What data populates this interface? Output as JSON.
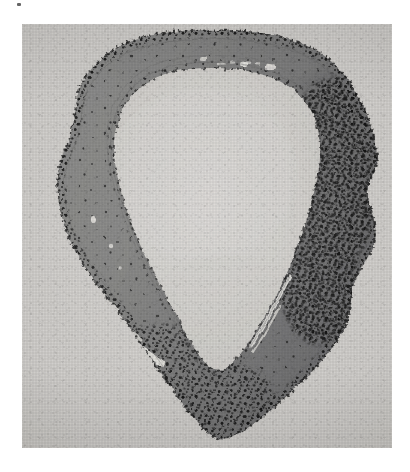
{
  "figure": {
    "kind": "photomicrograph",
    "modality": "brightfield light microscopy",
    "staining_tone": "grayscale halftone print"
  },
  "plate": {
    "left": 22,
    "top": 24,
    "width": 370,
    "height": 424,
    "background_color": "#d9d9d7",
    "border": "none"
  },
  "palette": {
    "page_white": "#ffffff",
    "print_background": "#d9d9d7",
    "background_light": "#dedcd9",
    "lumen_light": "#dbd9d6",
    "lumen_core": "#e2e0dd",
    "wall_mid_gray": "#8e8e8c",
    "wall_dark_gray": "#79797a",
    "wall_light_gray": "#a3a3a1",
    "nuclei_black": "#1d1d1d",
    "cleft_white": "#efeeea"
  },
  "regions": [
    {
      "id": "background",
      "name": "extra-luminal background",
      "description": "pale grainy field surrounding the specimen",
      "tone": "light gray"
    },
    {
      "id": "outer-wall",
      "name": "specimen wall",
      "description": "continuous medium-gray ring of tissue forming the full circumference",
      "tone": "medium gray"
    },
    {
      "id": "nuclei-band-outer",
      "name": "outer nuclear border",
      "description": "dashed line of dark nuclei following the outer contour",
      "tone": "black speckle"
    },
    {
      "id": "nuclei-band-inner",
      "name": "inner nuclear border",
      "description": "dark nuclei lining the luminal surface",
      "tone": "black speckle"
    },
    {
      "id": "dense-infiltrate-right",
      "name": "dense cellular zone",
      "description": "markedly crowded cluster of dark nuclei thickening the right half of the wall",
      "tone": "dense black speckle"
    },
    {
      "id": "lumen",
      "name": "lumen",
      "description": "pale empty central cavity enclosed by the wall",
      "tone": "pale gray"
    },
    {
      "id": "cleft-lower-left",
      "name": "clear cleft",
      "description": "bright slit-like space within the lower-left wall",
      "tone": "near white"
    },
    {
      "id": "cleft-lower-right",
      "name": "clear streak",
      "description": "bright linear streak along the inner edge of the lower-right wall",
      "tone": "near white"
    }
  ],
  "marks": [
    {
      "id": "corner-speck",
      "x": 17,
      "y": 3,
      "description": "small dark speck in the upper page margin"
    }
  ],
  "labels": {
    "visible_text": [],
    "scale_bar": null,
    "panel_letter": null,
    "caption": null
  }
}
